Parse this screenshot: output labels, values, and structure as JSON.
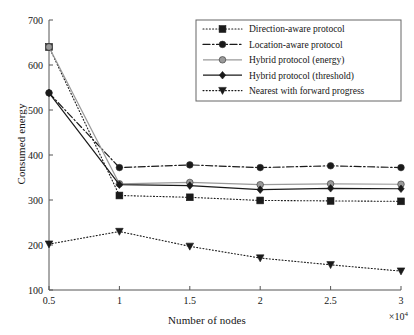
{
  "chart_data": {
    "type": "line",
    "title": "",
    "xlabel": "Number of nodes",
    "ylabel": "Consumed energy",
    "x_multiplier": "×10",
    "x_multiplier_exp": "4",
    "x": [
      0.5,
      1,
      1.5,
      2,
      2.5,
      3
    ],
    "xticklabels": [
      "0.5",
      "1",
      "1.5",
      "2",
      "2.5",
      "3"
    ],
    "xlim": [
      0.5,
      3
    ],
    "ylim": [
      100,
      700
    ],
    "yticks": [
      100,
      200,
      300,
      400,
      500,
      600,
      700
    ],
    "yticklabels": [
      "100",
      "200",
      "300",
      "400",
      "500",
      "600",
      "700"
    ],
    "grid": false,
    "legend_position": "upper right",
    "series": [
      {
        "name": "Direction-aware protocol",
        "values": [
          640,
          310,
          306,
          299,
          298,
          297
        ],
        "marker": "square",
        "linestyle": "dotted",
        "color": "#1a1a1a"
      },
      {
        "name": "Location-aware protocol",
        "values": [
          538,
          372,
          378,
          372,
          376,
          372
        ],
        "marker": "circle",
        "linestyle": "dashdot",
        "color": "#1a1a1a"
      },
      {
        "name": "Hybrid protocol (energy)",
        "values": [
          640,
          336,
          339,
          334,
          336,
          335
        ],
        "marker": "circle",
        "linestyle": "solid",
        "color": "#9a9a9a"
      },
      {
        "name": "Hybrid protocol (threshold)",
        "values": [
          538,
          334,
          332,
          323,
          326,
          325
        ],
        "marker": "diamond",
        "linestyle": "solid",
        "color": "#1a1a1a"
      },
      {
        "name": "Nearest with forward progress",
        "values": [
          202,
          230,
          197,
          171,
          156,
          142
        ],
        "marker": "triangle-down",
        "linestyle": "dotted",
        "color": "#1a1a1a"
      }
    ]
  }
}
